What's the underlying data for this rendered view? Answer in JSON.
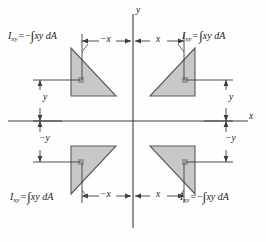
{
  "figure": {
    "name": "product-of-inertia-sign-convention",
    "background_color": "#fefefe",
    "line_color": "#3c3c3c",
    "shape_fill": "#c8c8c8",
    "shape_stroke": "#5a5a5a",
    "centroid_color": "#9a9a9a"
  },
  "axes": {
    "y_label": "y",
    "x_label": "x"
  },
  "quadrants": {
    "top_left": {
      "symbol": "I",
      "subscript": "xy",
      "equals": "=",
      "sign": "−",
      "integral": "∫",
      "integrand": "xy dA",
      "full": "I_xy = −∫xy dA"
    },
    "top_right": {
      "symbol": "I",
      "subscript": "xy",
      "equals": "=",
      "sign": "",
      "integral": "∫",
      "integrand": "xy dA",
      "full": "I_xy = ∫xy dA"
    },
    "bottom_left": {
      "symbol": "I",
      "subscript": "xy",
      "equals": "=",
      "sign": "",
      "integral": "∫",
      "integrand": "xy dA",
      "full": "I_xy = ∫xy dA"
    },
    "bottom_right": {
      "symbol": "I",
      "subscript": "xy",
      "equals": "=",
      "sign": "−",
      "integral": "∫",
      "integrand": "xy dA",
      "full": "I_xy = −∫xy dA"
    }
  },
  "dimensions": {
    "top_neg_x": "−x",
    "top_pos_x": "x",
    "bottom_neg_x": "−x",
    "bottom_pos_x": "x",
    "left_pos_y": "y",
    "right_pos_y": "y",
    "left_neg_y": "−y",
    "right_neg_y": "−y"
  }
}
